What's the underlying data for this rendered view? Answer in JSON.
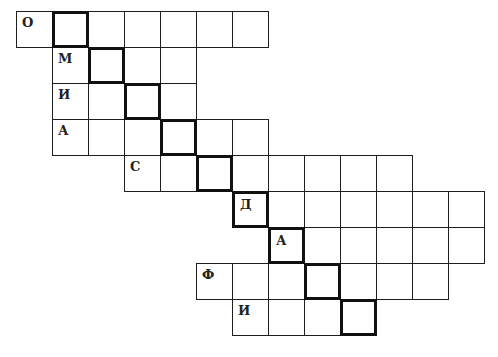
{
  "puzzle": {
    "type": "crossword",
    "cell_size": 36,
    "origin": {
      "x": 16,
      "y": 11
    },
    "key_word_description": "highlighted diagonal cells (bold outline)",
    "rows": [
      {
        "row": 0,
        "start_col": 0,
        "length": 7,
        "first_letter": "О",
        "key_col": 1
      },
      {
        "row": 1,
        "start_col": 1,
        "length": 4,
        "first_letter": "М",
        "key_col": 2
      },
      {
        "row": 2,
        "start_col": 1,
        "length": 4,
        "first_letter": "И",
        "key_col": 3
      },
      {
        "row": 3,
        "start_col": 1,
        "length": 6,
        "first_letter": "А",
        "key_col": 4
      },
      {
        "row": 4,
        "start_col": 3,
        "length": 8,
        "first_letter": "С",
        "key_col": 5
      },
      {
        "row": 5,
        "start_col": 6,
        "length": 7,
        "first_letter": "Д",
        "key_col": 6
      },
      {
        "row": 6,
        "start_col": 7,
        "length": 6,
        "first_letter": "А",
        "key_col": 7
      },
      {
        "row": 7,
        "start_col": 5,
        "length": 7,
        "first_letter": "Ф",
        "key_col": 8
      },
      {
        "row": 8,
        "start_col": 6,
        "length": 4,
        "first_letter": "И",
        "key_col": 9
      }
    ]
  }
}
